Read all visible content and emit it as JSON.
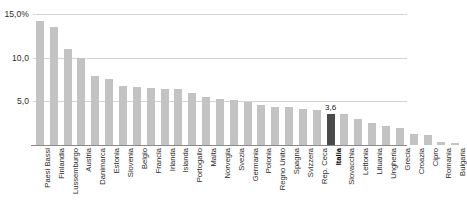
{
  "chart_data": {
    "type": "bar",
    "title": "",
    "subtitle": "",
    "xlabel": "",
    "ylabel": "",
    "ylim": [
      0,
      15
    ],
    "yticks": [
      5,
      10,
      15
    ],
    "ytick_labels": [
      "5,0",
      "10,0",
      "15,0%"
    ],
    "grid": true,
    "legend": "none",
    "highlight_category": "Italia",
    "highlight_value": "3,6",
    "highlight_color": "#4a4a4a",
    "bar_color": "#c3c3c3",
    "categories": [
      "Paesi Bassi",
      "Finlandia",
      "Lussemburgo",
      "Austria",
      "Danimarca",
      "Estonia",
      "Slovenia",
      "Belgio",
      "Francia",
      "Irlanda",
      "Islanda",
      "Portogallo",
      "Malta",
      "Norvegia",
      "Svezia",
      "Germania",
      "Polonia",
      "Regno Unito",
      "Spagna",
      "Svizzera",
      "Rep. Ceca",
      "Italia",
      "Slovacchia",
      "Lettonia",
      "Lituania",
      "Ungheria",
      "Grecia",
      "Croazia",
      "Cipro",
      "Romania",
      "Bulgaria"
    ],
    "values": [
      14.2,
      13.5,
      11.0,
      10.0,
      7.9,
      7.6,
      6.8,
      6.6,
      6.5,
      6.4,
      6.4,
      6.0,
      5.5,
      5.3,
      5.2,
      4.9,
      4.6,
      4.4,
      4.3,
      4.1,
      4.0,
      3.6,
      3.5,
      3.0,
      2.5,
      2.2,
      2.0,
      1.3,
      1.2,
      0.4,
      0.2
    ],
    "data_labels": {
      "21": "3,6"
    }
  }
}
